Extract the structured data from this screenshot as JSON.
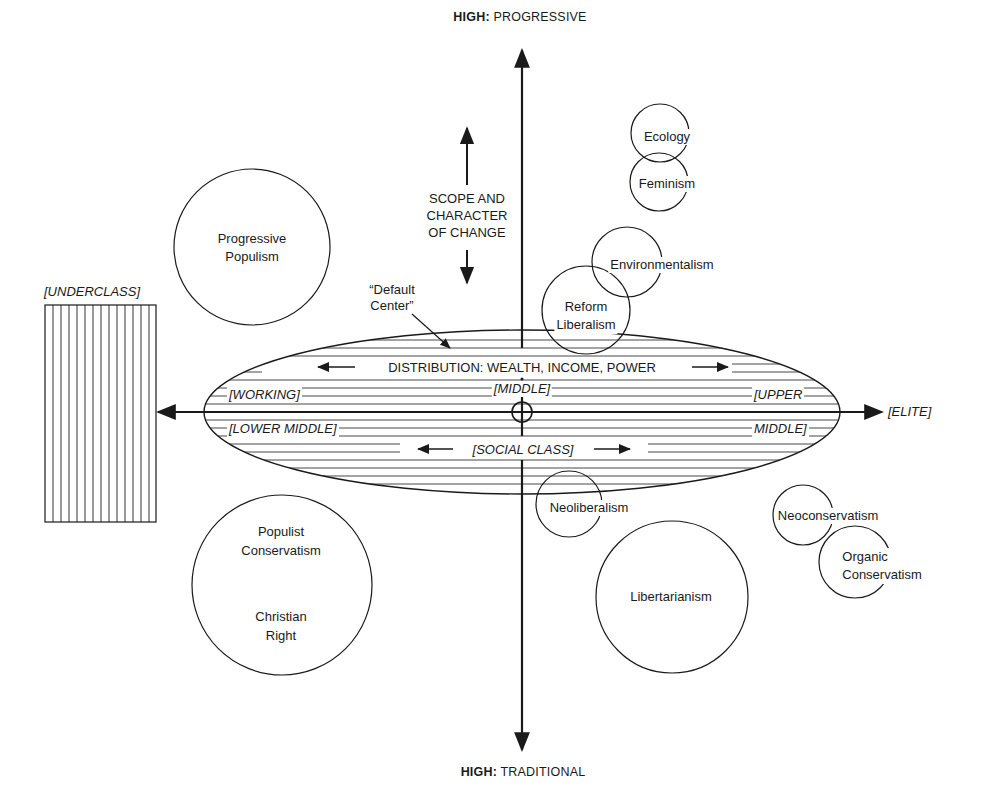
{
  "axes": {
    "top_label_bold": "HIGH:",
    "top_label": "PROGRESSIVE",
    "bottom_label_bold": "HIGH:",
    "bottom_label": "TRADITIONAL",
    "right_label": "[ELITE]",
    "left_label": "[UNDERCLASS]",
    "vertical_axis_title": [
      "SCOPE AND",
      "CHARACTER",
      "OF CHANGE"
    ]
  },
  "ellipse": {
    "title": "DISTRIBUTION: WEALTH, INCOME, POWER",
    "subtitle": "[SOCIAL CLASS]",
    "class_labels": {
      "working": "[WORKING]",
      "lower_middle": "[LOWER MIDDLE]",
      "middle": "[MIDDLE]",
      "upper": "[UPPER",
      "upper_middle": "MIDDLE]"
    }
  },
  "annotations": {
    "default_center_line1": "“Default",
    "default_center_line2": "Center”"
  },
  "ideologies": [
    {
      "id": "ecology",
      "lines": [
        "Ecology"
      ]
    },
    {
      "id": "feminism",
      "lines": [
        "Feminism"
      ]
    },
    {
      "id": "environmentalism",
      "lines": [
        "Environmentalism"
      ]
    },
    {
      "id": "reform-liberalism",
      "lines": [
        "Reform",
        "Liberalism"
      ]
    },
    {
      "id": "progressive-populism",
      "lines": [
        "Progressive",
        "Populism"
      ]
    },
    {
      "id": "populist-conservatism",
      "lines": [
        "Populist",
        "Conservatism"
      ]
    },
    {
      "id": "christian-right",
      "lines": [
        "Christian",
        "Right"
      ]
    },
    {
      "id": "neoliberalism",
      "lines": [
        "Neoliberalism"
      ]
    },
    {
      "id": "libertarianism",
      "lines": [
        "Libertarianism"
      ]
    },
    {
      "id": "neoconservatism",
      "lines": [
        "Neoconservatism"
      ]
    },
    {
      "id": "organic-conservatism",
      "lines": [
        "Organic",
        "Conservatism"
      ]
    }
  ],
  "colors": {
    "ink": "#1a1a1a",
    "background": "#ffffff"
  }
}
